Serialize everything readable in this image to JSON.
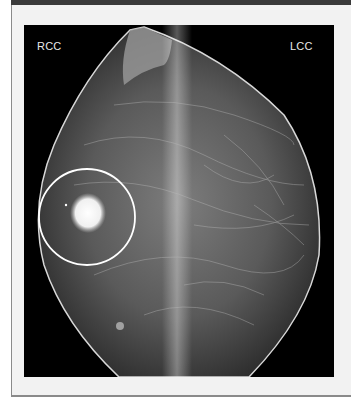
{
  "figure": {
    "labels": {
      "left_view": "RCC",
      "right_view": "LCC"
    },
    "annotation": {
      "shape": "circle",
      "color": "#ffffff",
      "description": "dense mass highlighted"
    },
    "colors": {
      "background": "#000000",
      "panel": "#f2f2f2",
      "topbar": "#3a3a3a"
    }
  }
}
